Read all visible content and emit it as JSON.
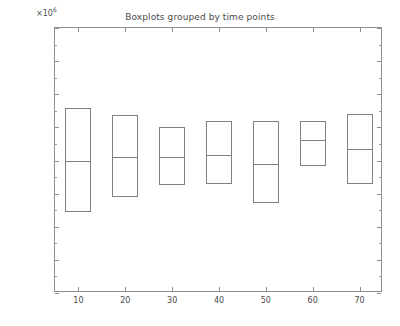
{
  "chart_data": {
    "type": "box",
    "title": "Boxplots grouped by time points",
    "xlabel": "",
    "ylabel": "",
    "exponent_label": "×10",
    "exponent_power": "6",
    "y_axis_multiplier": 1000000,
    "xlim": [
      5,
      75
    ],
    "ylim": [
      -0.5,
      3.5
    ],
    "grid": false,
    "legend": null,
    "box_style": "no-whiskers",
    "yticks": [
      3.5,
      3,
      2.5,
      2,
      1.5,
      1,
      0.5,
      0,
      -0.5
    ],
    "ytick_labels": [
      "3.5",
      "3",
      "2.5",
      "2",
      "1.5",
      "1",
      "0.5",
      "0",
      "-0.5"
    ],
    "ytick_minor_step": 0.25,
    "xticks": [
      10,
      20,
      30,
      40,
      50,
      60,
      70
    ],
    "xtick_labels": [
      "10",
      "20",
      "30",
      "40",
      "50",
      "60",
      "70"
    ],
    "categories": [
      "10",
      "20",
      "30",
      "40",
      "50",
      "60",
      "70"
    ],
    "boxes": [
      {
        "category": "10",
        "q1": 0.72,
        "median": 1.5,
        "q3": 2.3
      },
      {
        "category": "20",
        "q1": 0.95,
        "median": 1.55,
        "q3": 2.18
      },
      {
        "category": "30",
        "q1": 1.13,
        "median": 1.55,
        "q3": 2.0
      },
      {
        "category": "40",
        "q1": 1.15,
        "median": 1.58,
        "q3": 2.1
      },
      {
        "category": "50",
        "q1": 0.86,
        "median": 1.44,
        "q3": 2.1
      },
      {
        "category": "60",
        "q1": 1.42,
        "median": 1.81,
        "q3": 2.1
      },
      {
        "category": "70",
        "q1": 1.15,
        "median": 1.67,
        "q3": 2.2
      }
    ],
    "colors": {
      "box_edge": "#808080",
      "axis": "#8f8f8f",
      "text": "#4a4a4a",
      "background": "#ffffff"
    }
  }
}
